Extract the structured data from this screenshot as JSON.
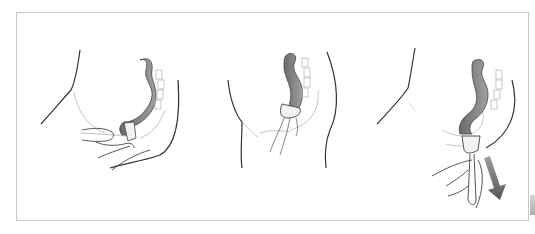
{
  "figure": {
    "panels": [
      {
        "id": 1,
        "description": "cup-folded-insertion",
        "arrow": false
      },
      {
        "id": 2,
        "description": "cup-opened-in-place",
        "arrow": false
      },
      {
        "id": 3,
        "description": "cup-removal",
        "arrow": true
      }
    ],
    "colors": {
      "border": "#c8c8c8",
      "line": "#333333",
      "canal_fill": "#8a8a8a",
      "canal_dark": "#5a5a5a",
      "light_line": "#aaaaaa",
      "arrow_start": "#9a9a9a",
      "arrow_end": "#555555",
      "background": "#ffffff"
    }
  }
}
